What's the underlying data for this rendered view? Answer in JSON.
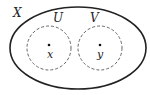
{
  "diagram": {
    "space": {
      "label": "X",
      "cx": 78,
      "cy": 48,
      "rx": 68,
      "ry": 41,
      "stroke": "#222222",
      "stroke_width": 1.6
    },
    "open_sets": [
      {
        "label": "U",
        "cx": 49,
        "cy": 48,
        "r": 22,
        "dashed": true
      },
      {
        "label": "V",
        "cx": 100,
        "cy": 48,
        "r": 22,
        "dashed": true
      }
    ],
    "points": [
      {
        "label": "x",
        "cx": 49,
        "cy": 45
      },
      {
        "label": "y",
        "cx": 100,
        "cy": 45
      }
    ]
  }
}
